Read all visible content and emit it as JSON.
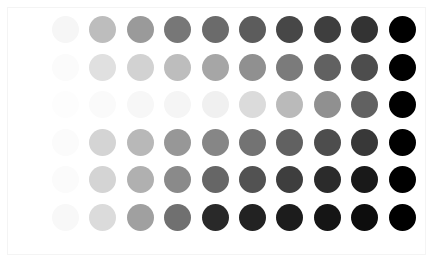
{
  "figure": {
    "type": "grayscale-circle-matrix",
    "background_color": "#ffffff",
    "border_color": "#f4f4f4",
    "rows": 6,
    "columns": 10,
    "dot_diameter_px": 27,
    "column_spacing_px": 37.4,
    "row_spacing_px": 37.5,
    "first_dot_left_px": 52,
    "first_row_top_px": 16
  },
  "chart_data": {
    "type": "heatmap",
    "title": "",
    "subtitle": "",
    "xlabel": "",
    "ylabel": "",
    "grid": false,
    "legend": "none",
    "marker": "circle",
    "colormap": "grayscale",
    "x": [
      1,
      2,
      3,
      4,
      5,
      6,
      7,
      8,
      9,
      10
    ],
    "categories": [
      "1",
      "2",
      "3",
      "4",
      "5",
      "6",
      "7",
      "8",
      "9",
      "10"
    ],
    "row_labels": [
      "row-1",
      "row-2",
      "row-3",
      "row-4",
      "row-5",
      "row-6"
    ],
    "xticklabels": [],
    "yticklabels": [],
    "value_range": [
      0,
      1
    ],
    "series": [
      {
        "name": "row-1",
        "values": [
          0.03,
          0.26,
          0.4,
          0.53,
          0.58,
          0.64,
          0.72,
          0.76,
          0.8,
          1.0
        ],
        "colors": [
          "#f6f6f6",
          "#bdbdbd",
          "#9a9a9a",
          "#777777",
          "#6b6b6b",
          "#5c5c5c",
          "#474747",
          "#3e3e3e",
          "#333333",
          "#000000"
        ]
      },
      {
        "name": "row-2",
        "values": [
          0.01,
          0.12,
          0.18,
          0.26,
          0.35,
          0.44,
          0.52,
          0.62,
          0.7,
          1.0
        ],
        "colors": [
          "#fbfbfb",
          "#e0e0e0",
          "#d2d2d2",
          "#bdbdbd",
          "#a6a6a6",
          "#909090",
          "#7b7b7b",
          "#616161",
          "#4d4d4d",
          "#000000"
        ]
      },
      {
        "name": "row-3",
        "values": [
          0.0,
          0.01,
          0.02,
          0.03,
          0.05,
          0.14,
          0.27,
          0.44,
          0.62,
          1.0
        ],
        "colors": [
          "#fdfdfd",
          "#fafafa",
          "#f7f7f7",
          "#f5f5f5",
          "#f0f0f0",
          "#dbdbdb",
          "#bababa",
          "#909090",
          "#616161",
          "#000000"
        ]
      },
      {
        "name": "row-4",
        "values": [
          0.01,
          0.17,
          0.28,
          0.41,
          0.48,
          0.55,
          0.62,
          0.7,
          0.78,
          1.0
        ],
        "colors": [
          "#fbfbfb",
          "#d4d4d4",
          "#b8b8b8",
          "#979797",
          "#868686",
          "#737373",
          "#616161",
          "#4d4d4d",
          "#383838",
          "#000000"
        ]
      },
      {
        "name": "row-5",
        "values": [
          0.01,
          0.17,
          0.31,
          0.46,
          0.6,
          0.68,
          0.76,
          0.83,
          0.9,
          1.0
        ],
        "colors": [
          "#fbfbfb",
          "#d4d4d4",
          "#b0b0b0",
          "#8a8a8a",
          "#666666",
          "#525252",
          "#3e3e3e",
          "#2b2b2b",
          "#191919",
          "#000000"
        ]
      },
      {
        "name": "row-6",
        "values": [
          0.02,
          0.14,
          0.37,
          0.56,
          0.84,
          0.87,
          0.89,
          0.92,
          0.95,
          1.0
        ],
        "colors": [
          "#f8f8f8",
          "#dbdbdb",
          "#a0a0a0",
          "#707070",
          "#292929",
          "#222222",
          "#1c1c1c",
          "#151515",
          "#0d0d0d",
          "#000000"
        ]
      }
    ]
  }
}
